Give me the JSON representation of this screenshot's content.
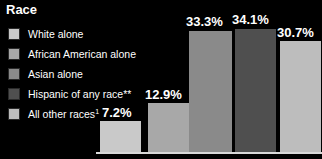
{
  "title": "Race",
  "background_color": "#000000",
  "text_color": "#ffffff",
  "baseline_color": "#d8d8d8",
  "legend": {
    "items": [
      {
        "label": "White alone",
        "color": "#c9c9c9"
      },
      {
        "label": "African American alone",
        "color": "#a8a8a8"
      },
      {
        "label": "Asian alone",
        "color": "#8a8a8a"
      },
      {
        "label": "Hispanic of any race**",
        "color": "#4f4f4f"
      },
      {
        "label": "All other races",
        "sup": "1",
        "color": "#bdbdbd"
      }
    ]
  },
  "chart_data": {
    "type": "bar",
    "title": "Race",
    "xlabel": "",
    "ylabel": "",
    "ylim": [
      0,
      36
    ],
    "grid": false,
    "legend_position": "left",
    "categories": [
      "White alone",
      "African American alone",
      "Asian alone",
      "Hispanic of any race**",
      "All other races1"
    ],
    "values": [
      7.2,
      12.9,
      33.3,
      34.1,
      30.7
    ],
    "value_labels": [
      "7.2%",
      "12.9%",
      "33.3%",
      "34.1%",
      "30.7%"
    ],
    "colors": [
      "#c9c9c9",
      "#a8a8a8",
      "#8a8a8a",
      "#4f4f4f",
      "#bdbdbd"
    ],
    "bar_geometry": [
      {
        "left": 100,
        "width": 41,
        "top": 121,
        "label_left": 102,
        "label_top": 106
      },
      {
        "left": 148,
        "width": 41,
        "top": 103,
        "label_left": 145,
        "label_top": 88
      },
      {
        "left": 189,
        "width": 43,
        "top": 31,
        "label_left": 186,
        "label_top": 15
      },
      {
        "left": 235,
        "width": 41,
        "top": 29,
        "label_left": 232,
        "label_top": 13
      },
      {
        "left": 280,
        "width": 41,
        "top": 41,
        "label_left": 277,
        "label_top": 26
      }
    ]
  }
}
